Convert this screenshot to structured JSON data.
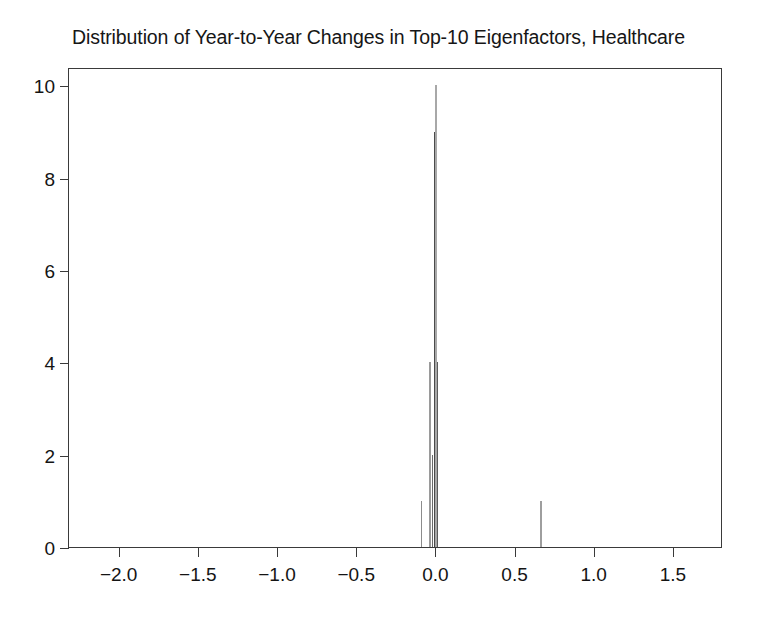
{
  "chart_data": {
    "type": "bar",
    "title": "Distribution of Year-to-Year Changes in Top-10 Eigenfactors, Healthcare",
    "xlabel": "",
    "ylabel": "",
    "xlim": [
      -2.32,
      1.81
    ],
    "ylim": [
      0,
      10.4
    ],
    "grid": false,
    "legend": null,
    "bin_width": 0.012,
    "x_ticks": [
      -2.0,
      -1.5,
      -1.0,
      -0.5,
      0.0,
      0.5,
      1.0,
      1.5
    ],
    "x_tick_labels": [
      "−2.0",
      "−1.5",
      "−1.0",
      "−0.5",
      "0.0",
      "0.5",
      "1.0",
      "1.5"
    ],
    "y_ticks": [
      0,
      2,
      4,
      6,
      8,
      10
    ],
    "y_tick_labels": [
      "0",
      "2",
      "4",
      "6",
      "8",
      "10"
    ],
    "x": [
      -0.095,
      -0.04,
      -0.025,
      -0.012,
      0.0,
      0.008,
      0.66
    ],
    "values": [
      1,
      4,
      2,
      9,
      10,
      4,
      1
    ],
    "bars": [
      {
        "x": -0.095,
        "value": 1,
        "color": "#8c8c8c",
        "width": 1.4
      },
      {
        "x": -0.04,
        "value": 4,
        "color": "#9a9a9a",
        "width": 1.4
      },
      {
        "x": -0.025,
        "value": 2,
        "color": "#6b6b6b",
        "width": 1.4
      },
      {
        "x": -0.012,
        "value": 9,
        "color": "#4a4a4a",
        "width": 1.8
      },
      {
        "x": 0.0,
        "value": 10,
        "color": "#a8a8a8",
        "width": 1.8
      },
      {
        "x": 0.008,
        "value": 4,
        "color": "#5c5c5c",
        "width": 1.4
      },
      {
        "x": 0.66,
        "value": 1,
        "color": "#9e9e9e",
        "width": 1.4
      }
    ]
  },
  "figure": {
    "background_color": "#ffffff",
    "axis_color": "#3a3a3a",
    "text_color": "#141414"
  }
}
